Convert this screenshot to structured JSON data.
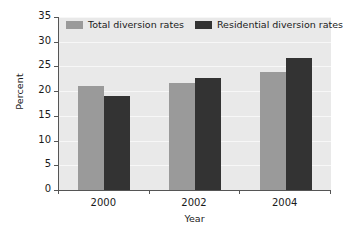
{
  "chart_data": {
    "type": "bar",
    "title": "",
    "xlabel": "Year",
    "ylabel": "Percent",
    "categories": [
      "2000",
      "2002",
      "2004"
    ],
    "series": [
      {
        "name": "Total diversion rates",
        "color": "#9a9a9a",
        "values": [
          21.0,
          21.7,
          23.9
        ]
      },
      {
        "name": "Residential diversion rates",
        "color": "#333333",
        "values": [
          19.0,
          22.7,
          26.8
        ]
      }
    ],
    "ylim": [
      0,
      35
    ],
    "yticks": [
      0,
      5,
      10,
      15,
      20,
      25,
      30,
      35
    ],
    "ytick_labels": [
      "0",
      "5",
      "10",
      "15",
      "20",
      "25",
      "30",
      "35"
    ],
    "grid": true,
    "grid_color": "#f7f7f7",
    "plot_background": "#e9e9e9",
    "legend_position": "top-left-inside",
    "axis_color": "#555555"
  }
}
